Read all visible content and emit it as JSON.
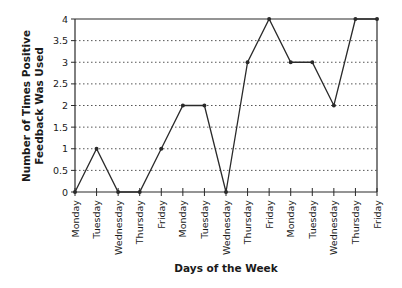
{
  "chart_data": {
    "type": "line",
    "title": "",
    "xlabel": "Days of the Week",
    "ylabel_line1": "Number of Times Positive",
    "ylabel_line2": "Feedback Was Used",
    "ylabel": "Number of Times Positive Feedback Was Used",
    "categories": [
      "Monday",
      "Tuesday",
      "Wednesday",
      "Thursday",
      "Friday",
      "Monday",
      "Tuesday",
      "Wednesday",
      "Thursday",
      "Friday",
      "Monday",
      "Tuesday",
      "Wednesday",
      "Thursday",
      "Friday"
    ],
    "values": [
      0,
      1,
      0,
      0,
      1,
      2,
      2,
      0,
      3,
      4,
      3,
      3,
      2,
      4,
      4
    ],
    "ylim": [
      0,
      4
    ],
    "yticks": [
      "0",
      "0.5",
      "1",
      "1.5",
      "2",
      "2.5",
      "3",
      "3.5",
      "4"
    ],
    "ytick_values": [
      0,
      0.5,
      1,
      1.5,
      2,
      2.5,
      3,
      3.5,
      4
    ],
    "grid": "horizontal dotted",
    "legend": null,
    "colors": {
      "line": "#2a2a2a",
      "grid": "#555555",
      "axis": "#2a2a2a"
    }
  }
}
